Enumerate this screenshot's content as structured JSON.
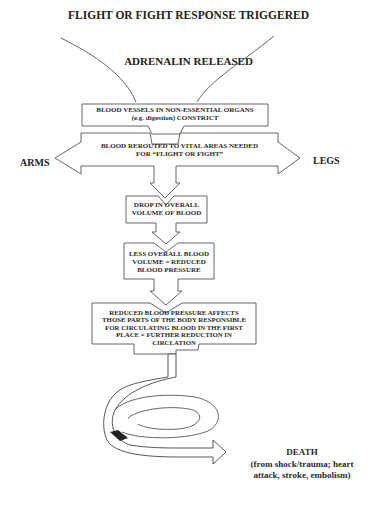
{
  "diagram": {
    "title": "FLIGHT OR FIGHT RESPONSE TRIGGERED",
    "trigger": "ADRENALIN RELEASED",
    "steps": [
      {
        "lines": [
          "BLOOD VESSELS IN NON-ESSENTIAL ORGANS",
          "(e.g. digestion) CONSTRICT"
        ]
      },
      {
        "lines": [
          "BLOOD REROUTED TO VITAL AREAS NEEDED",
          "FOR “FLIGHT OR FIGHT”"
        ]
      },
      {
        "lines": [
          "DROP IN OVERALL",
          "VOLUME OF BLOOD"
        ]
      },
      {
        "lines": [
          "LESS OVERALL BLOOD",
          "VOLUME = REDUCED",
          "BLOOD PRESSURE"
        ]
      },
      {
        "lines": [
          "REDUCED BLOOD PRESSURE AFFECTS",
          "THOSE PARTS OF THE BODY RESPONSIBLE",
          "FOR CIRCULATING BLOOD IN THE FIRST",
          "PLACE = FURTHER REDUCTION IN",
          "CIRCLATION"
        ]
      }
    ],
    "left_label": "ARMS",
    "right_label": "LEGS",
    "outcome": {
      "title": "DEATH",
      "lines": [
        "(from shock/trauma; heart",
        "attack, stroke, embolism)"
      ]
    }
  }
}
